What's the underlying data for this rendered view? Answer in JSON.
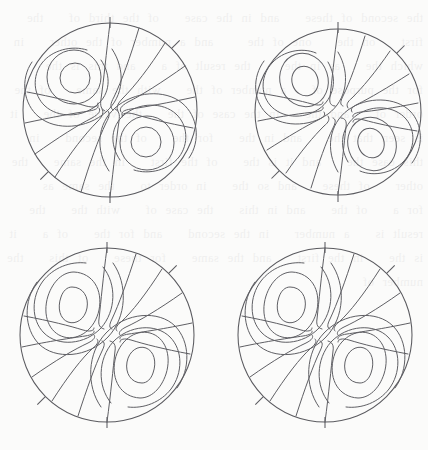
{
  "figure": {
    "name": "streamline-contour-panel-grid",
    "background_color": "#fbfbfa",
    "line_color": "#5f5f64",
    "boundary_color": "#5a5a5f",
    "rows": 2,
    "columns": 2,
    "canvas": {
      "width": 428,
      "height": 450
    }
  },
  "chart_data": {
    "type": "line",
    "title": "",
    "subtitle": "",
    "xlabel": "",
    "ylabel": "",
    "grid": false,
    "legend": "none",
    "plot_kind": "streamline-contour",
    "domain_shape": "circle",
    "panel_count": 4,
    "shared": {
      "boundary_tick_angles_deg": [
        90,
        45,
        270,
        225
      ],
      "boundary_tick_length": 11,
      "vortex_count": 2,
      "vortex_centers_normalized": [
        {
          "x": -0.34,
          "y": 0.3,
          "sense": "counterclockwise"
        },
        {
          "x": 0.34,
          "y": -0.3,
          "sense": "clockwise"
        }
      ],
      "spiral_arm_count": 12,
      "symmetry": "point-symmetric about panel centre"
    },
    "panels": [
      {
        "id": "panel-top-left",
        "position": "top-left",
        "center": {
          "x": 110,
          "y": 110
        },
        "radius": 87,
        "eye_contour_levels": [
          0.3,
          0.58,
          0.86
        ],
        "eye_shape": "circular",
        "streamline_style": "continuous",
        "arms_reach_center": true
      },
      {
        "id": "panel-top-right",
        "position": "top-right",
        "center": {
          "x": 338,
          "y": 112
        },
        "radius": 83,
        "eye_contour_levels": [
          0.3,
          0.58,
          0.86
        ],
        "eye_shape": "oval",
        "streamline_style": "broken-hooked",
        "arms_reach_center": false
      },
      {
        "id": "panel-bottom-left",
        "position": "bottom-left",
        "center": {
          "x": 107,
          "y": 335
        },
        "radius": 87,
        "eye_contour_levels": [
          0.28,
          0.56,
          0.84
        ],
        "eye_shape": "teardrop",
        "streamline_style": "broken-hooked",
        "arms_reach_center": false
      },
      {
        "id": "panel-bottom-right",
        "position": "bottom-right",
        "center": {
          "x": 325,
          "y": 335
        },
        "radius": 87,
        "eye_contour_levels": [
          0.28,
          0.56,
          0.84
        ],
        "eye_shape": "teardrop",
        "streamline_style": "broken-hooked",
        "arms_reach_center": false
      }
    ]
  },
  "artifacts": {
    "show_bleed_through": true,
    "bleed_text": "the second of these   and in the case   of the third of   the first   on the   one of the    and a number of the other   in which the   as in the    the result of a   and this is the   for the purpose of   a number of the   with the same   of the order of   and the   in the case of the   the value of the   it is seen that the   and in the   for the   of the second   in this case the   and it is the   of the first   in the same   the other   of these   and so the   in order to   the same as   for a   of the   and in this   the case of   with the   the result is   a number   in the second   and for the   of a   it is the   in the first   and the same   for these   of this   the number of"
  }
}
